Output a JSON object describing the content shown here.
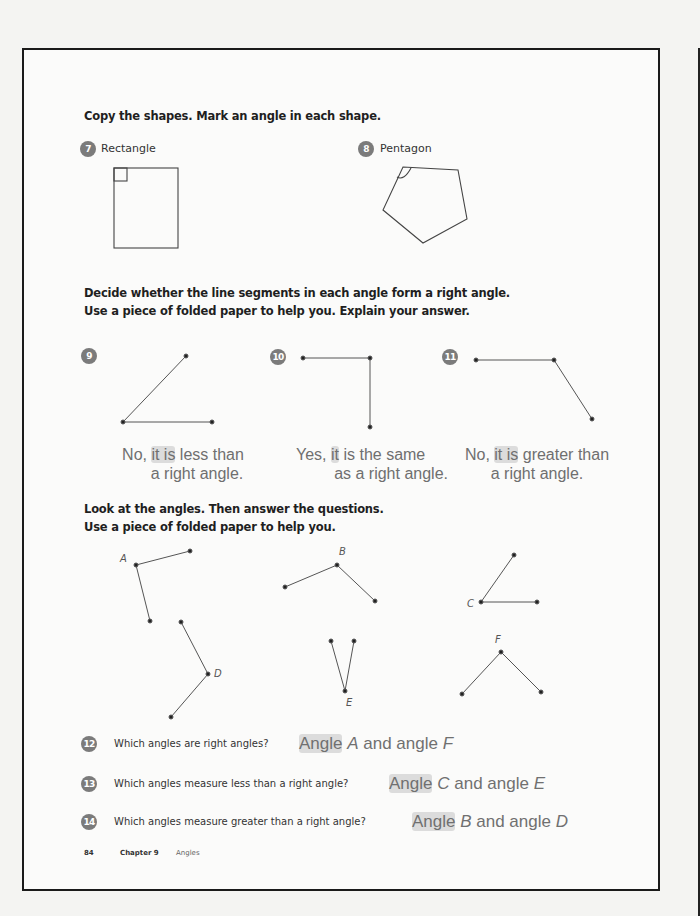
{
  "section1": {
    "heading": "Copy the shapes. Mark an angle in each shape.",
    "items": [
      {
        "number": "7",
        "label": "Rectangle"
      },
      {
        "number": "8",
        "label": "Pentagon"
      }
    ]
  },
  "section2": {
    "heading_line1": "Decide whether the line segments in each angle form a right angle.",
    "heading_line2": "Use a piece of folded paper to help you. Explain your answer.",
    "items": [
      {
        "number": "9",
        "answer_line1_pre": "No, ",
        "answer_line1_hl": "it is",
        "answer_line1_post": " less than",
        "answer_line2": "a right angle."
      },
      {
        "number": "10",
        "answer_line1_pre": "Yes, ",
        "answer_line1_hl": "it",
        "answer_line1_post": " is the same",
        "answer_line2": "as a right angle."
      },
      {
        "number": "11",
        "answer_line1_pre": "No, ",
        "answer_line1_hl": "it is",
        "answer_line1_post": " greater than",
        "answer_line2": "a right angle."
      }
    ]
  },
  "section3": {
    "heading_line1": "Look at the angles. Then answer the questions.",
    "heading_line2": "Use a piece of folded paper to help you.",
    "angle_labels": {
      "A": "A",
      "B": "B",
      "C": "C",
      "D": "D",
      "E": "E",
      "F": "F"
    },
    "questions": [
      {
        "number": "12",
        "text": "Which angles are right angles?",
        "answer_hl": "Angle",
        "answer_v1": "A",
        "answer_mid": " and angle ",
        "answer_v2": "F"
      },
      {
        "number": "13",
        "text": "Which angles measure less than a right angle?",
        "answer_hl": "Angle",
        "answer_v1": "C",
        "answer_mid": " and angle ",
        "answer_v2": "E"
      },
      {
        "number": "14",
        "text": "Which angles measure greater than a right angle?",
        "answer_hl": "Angle",
        "answer_v1": "B",
        "answer_mid": " and angle ",
        "answer_v2": "D"
      }
    ]
  },
  "footer": {
    "page_number": "84",
    "chapter": "Chapter 9",
    "chapter_title": "Angles"
  }
}
